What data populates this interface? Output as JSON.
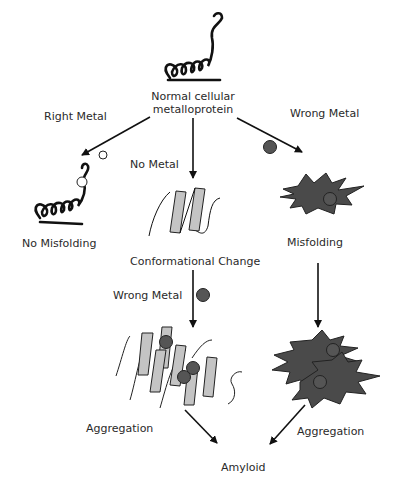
{
  "diagram": {
    "nodes": {
      "normal": {
        "label_line1": "Normal cellular",
        "label_line2": "metalloprotein",
        "icon": "coiled-protein-icon"
      },
      "no_misfolding": {
        "label": "No Misfolding",
        "icon": "coiled-protein-with-metal-icon"
      },
      "conformational_change": {
        "label": "Conformational Change",
        "icon": "beta-sheet-icon"
      },
      "misfolding": {
        "label": "Misfolding",
        "icon": "misfolded-star-icon"
      },
      "aggregation_left": {
        "label": "Aggregation",
        "icon": "beta-sheet-aggregate-icon"
      },
      "aggregation_right": {
        "label": "Aggregation",
        "icon": "star-aggregate-icon"
      },
      "amyloid": {
        "label": "Amyloid"
      }
    },
    "edges": {
      "right_metal": "Right Metal",
      "no_metal": "No Metal",
      "wrong_metal_top": "Wrong Metal",
      "wrong_metal_mid": "Wrong Metal"
    },
    "colors": {
      "right_metal_fill": "#ffffff",
      "wrong_metal_fill": "#555555",
      "sheet_fill": "#c4c4c4",
      "misfold_fill": "#4a4a4a",
      "line": "#111111"
    }
  }
}
